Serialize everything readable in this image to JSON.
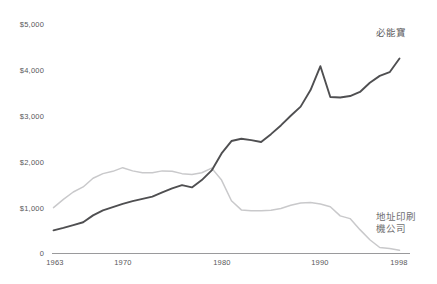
{
  "chart_data": {
    "type": "line",
    "title": "",
    "xlabel": "",
    "ylabel": "",
    "xlim": [
      1963,
      1998
    ],
    "ylim": [
      0,
      5000
    ],
    "grid": false,
    "legend_position": "inline-right",
    "y_ticks": [
      0,
      1000,
      2000,
      3000,
      4000,
      5000
    ],
    "y_tick_labels": [
      "0",
      "$1,000",
      "$2,000",
      "$3,000",
      "$4,000",
      "$5,000"
    ],
    "x_ticks": [
      1963,
      1970,
      1980,
      1990,
      1998
    ],
    "x_tick_labels": [
      "1963",
      "1970",
      "1980",
      "1990",
      "1998"
    ],
    "x": [
      1963,
      1964,
      1965,
      1966,
      1967,
      1968,
      1969,
      1970,
      1971,
      1972,
      1973,
      1974,
      1975,
      1976,
      1977,
      1978,
      1979,
      1980,
      1981,
      1982,
      1983,
      1984,
      1985,
      1986,
      1987,
      1988,
      1989,
      1990,
      1991,
      1992,
      1993,
      1994,
      1995,
      1996,
      1997,
      1998
    ],
    "series": [
      {
        "name": "必能寶",
        "color": "#4f4f51",
        "width": 1.9,
        "values": [
          505,
          560,
          620,
          680,
          830,
          940,
          1010,
          1080,
          1140,
          1190,
          1240,
          1330,
          1420,
          1490,
          1440,
          1600,
          1810,
          2180,
          2450,
          2500,
          2470,
          2430,
          2600,
          2790,
          3000,
          3200,
          3560,
          4080,
          3410,
          3400,
          3430,
          3520,
          3720,
          3870,
          3950,
          4250
        ]
      },
      {
        "name": "地址印刷機公司",
        "color": "#c9c9cb",
        "width": 1.5,
        "values": [
          1000,
          1180,
          1340,
          1450,
          1640,
          1740,
          1790,
          1870,
          1800,
          1760,
          1760,
          1800,
          1790,
          1740,
          1720,
          1760,
          1860,
          1600,
          1150,
          950,
          930,
          930,
          940,
          980,
          1050,
          1100,
          1110,
          1080,
          1020,
          820,
          760,
          520,
          300,
          130,
          110,
          70
        ]
      }
    ],
    "annotations": [
      {
        "text": "必能寶",
        "series": 0,
        "at_x": 1998
      },
      {
        "text_line1": "地址印刷",
        "text_line2": "機公司",
        "series": 1,
        "at_x": 1998
      }
    ]
  },
  "labels": {
    "y": {
      "t5000": "$5,000",
      "t4000": "$4,000",
      "t3000": "$3,000",
      "t2000": "$2,000",
      "t1000": "$1,000",
      "t0": "0"
    },
    "x": {
      "t1963": "1963",
      "t1970": "1970",
      "t1980": "1980",
      "t1990": "1990",
      "t1998": "1998"
    },
    "series_dark": "必能寶",
    "series_light_line1": "地址印刷",
    "series_light_line2": "機公司"
  },
  "title": {
    "text": ""
  },
  "colors": {
    "dark_series": "#4f4f51",
    "light_series": "#c9c9cb",
    "axis": "#9a9a9c",
    "text": "#58585a",
    "background": "#ffffff"
  }
}
